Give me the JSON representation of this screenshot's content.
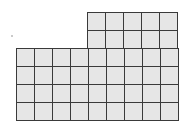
{
  "diagram": {
    "type": "unit-square-grid-shape",
    "cell_size_px": 18,
    "colors": {
      "cell_fill": "#e6e6e6",
      "line": "#3a3a3a",
      "background": "#ffffff"
    },
    "top_block": {
      "columns": 5,
      "rows": 2,
      "x": 87,
      "y": 12
    },
    "bottom_block": {
      "columns": 9,
      "rows": 4,
      "x": 16,
      "y": 48
    },
    "total_unit_squares": 46
  }
}
